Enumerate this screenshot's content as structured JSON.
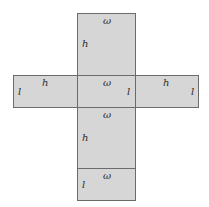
{
  "diagram": {
    "type": "box-net",
    "faces": [
      {
        "id": "top-flap",
        "labels": {
          "width": "ω",
          "height": "h"
        }
      },
      {
        "id": "left-side",
        "labels": {
          "height": "h",
          "length": "l"
        }
      },
      {
        "id": "center-base",
        "labels": {
          "width": "ω",
          "length": "l"
        }
      },
      {
        "id": "right-side",
        "labels": {
          "height": "h",
          "length": "l"
        }
      },
      {
        "id": "bottom-flap",
        "labels": {
          "width": "ω",
          "height": "h"
        }
      },
      {
        "id": "bottom-lid",
        "labels": {
          "width": "ω",
          "length": "l"
        }
      }
    ],
    "colors": {
      "face_fill": "#d6d6d6",
      "edge": "#6b6b6b"
    }
  }
}
